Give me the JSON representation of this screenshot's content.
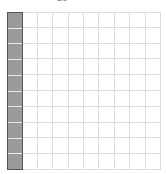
{
  "title": "10",
  "grid": {
    "rows": 10,
    "columns": 10,
    "filled_columns": 1,
    "filled_color": "#9a9a9a",
    "filled_border_color": "#555555",
    "grid_line_color": "#dcdcdc"
  }
}
